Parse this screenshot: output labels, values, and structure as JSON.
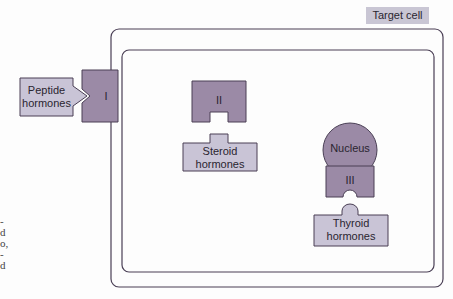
{
  "title_label": "Target cell",
  "receptors": {
    "membrane": {
      "label": "I"
    },
    "cytoplasmic": {
      "label": "II"
    },
    "nuclear": {
      "label": "III"
    }
  },
  "nucleus_label": "Nucleus",
  "hormones": {
    "peptide": {
      "line1": "Peptide",
      "line2": "hormones"
    },
    "steroid": {
      "line1": "Steroid",
      "line2": "hormones"
    },
    "thyroid": {
      "line1": "Thyroid",
      "line2": "hormones"
    }
  },
  "edge_text_fragments": [
    "-",
    "d",
    "o,",
    "-",
    "d"
  ],
  "colors": {
    "receptor_fill": "#9b8aa6",
    "hormone_fill": "#c9c4d6",
    "outline": "#4a3f55",
    "label_bg": "#c9c6d4"
  }
}
